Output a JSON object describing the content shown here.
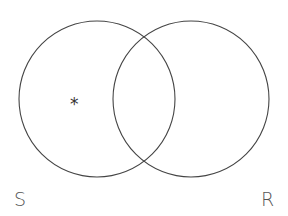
{
  "diagram": {
    "type": "venn",
    "sets": [
      {
        "id": "S",
        "label": "S",
        "cx": 97,
        "cy": 99,
        "r": 78
      },
      {
        "id": "R",
        "label": "R",
        "cx": 191,
        "cy": 99,
        "r": 78
      }
    ],
    "markers": [
      {
        "symbol": "*",
        "region": "S only",
        "x": 75,
        "y": 107
      }
    ],
    "stroke_color": "#444444",
    "label_color": "#555555"
  }
}
